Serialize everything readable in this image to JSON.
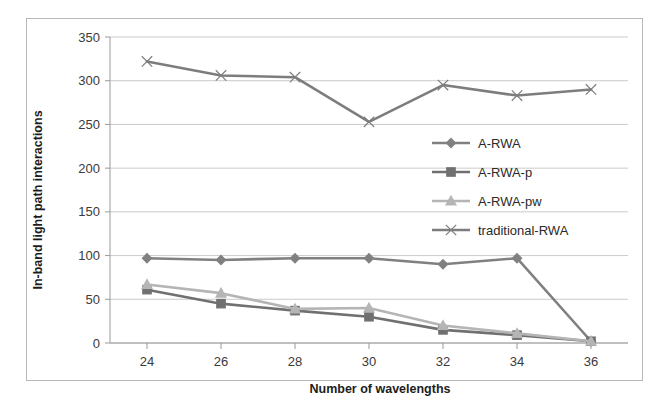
{
  "chart_data": {
    "type": "line",
    "title": "",
    "xlabel": "Number of wavelengths",
    "ylabel": "In-band light path interactions",
    "x": [
      24,
      26,
      28,
      30,
      32,
      34,
      36
    ],
    "xticklabels": [
      "24",
      "26",
      "28",
      "30",
      "32",
      "34",
      "36"
    ],
    "yticklabels": [
      "0",
      "50",
      "100",
      "150",
      "200",
      "250",
      "300",
      "350"
    ],
    "yticks": [
      0,
      50,
      100,
      150,
      200,
      250,
      300,
      350
    ],
    "ylim": [
      0,
      350
    ],
    "xlim": [
      23,
      37
    ],
    "grid": "horizontal",
    "legend_position": "center-right inside plot",
    "series": [
      {
        "name": "A-RWA",
        "values": [
          97,
          95,
          97,
          97,
          90,
          97,
          2
        ],
        "color": "#808080",
        "marker": "diamond"
      },
      {
        "name": "A-RWA-p",
        "values": [
          61,
          45,
          37,
          30,
          15,
          9,
          2
        ],
        "color": "#707070",
        "marker": "square"
      },
      {
        "name": "A-RWA-pw",
        "values": [
          67,
          57,
          39,
          40,
          20,
          11,
          2
        ],
        "color": "#b5b5b5",
        "marker": "triangle"
      },
      {
        "name": "traditional-RWA",
        "values": [
          322,
          306,
          304,
          253,
          295,
          283,
          290
        ],
        "color": "#7d7d7d",
        "marker": "x"
      }
    ]
  },
  "legend": {
    "items": [
      {
        "label": "A-RWA"
      },
      {
        "label": "A-RWA-p"
      },
      {
        "label": "A-RWA-pw"
      },
      {
        "label": "traditional-RWA"
      }
    ]
  },
  "axes": {
    "x_title": "Number of wavelengths",
    "y_title": "In-band light path interactions"
  },
  "colors": {
    "frame_border": "#b9b9b9",
    "gridline": "#c4c4c4",
    "axis": "#9a9a9a",
    "tick_text": "#3a3a3a",
    "title_text": "#1d1d1d"
  }
}
